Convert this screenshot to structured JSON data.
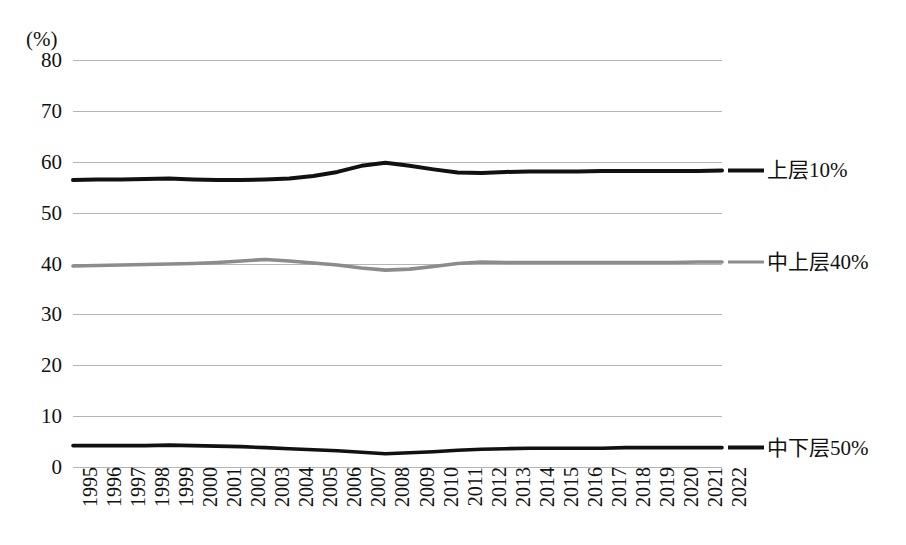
{
  "chart_data": {
    "type": "line",
    "title": "",
    "subtitle": "",
    "xlabel": "",
    "ylabel": "",
    "unit_label": "(%)",
    "grid": true,
    "legend_position": "right",
    "ylim": [
      0,
      80
    ],
    "y_ticks": [
      80,
      70,
      60,
      50,
      40,
      30,
      20,
      10,
      0
    ],
    "categories": [
      "1995",
      "1996",
      "1997",
      "1998",
      "1999",
      "2000",
      "2001",
      "2002",
      "2003",
      "2004",
      "2005",
      "2006",
      "2007",
      "2008",
      "2009",
      "2010",
      "2011",
      "2012",
      "2013",
      "2014",
      "2015",
      "2016",
      "2017",
      "2018",
      "2019",
      "2020",
      "2021",
      "2022"
    ],
    "series": [
      {
        "name": "上层10%",
        "color": "#111111",
        "width": 4.0,
        "values": [
          56.4,
          56.5,
          56.5,
          56.6,
          56.7,
          56.5,
          56.4,
          56.4,
          56.5,
          56.7,
          57.2,
          58.0,
          59.2,
          59.8,
          59.2,
          58.5,
          57.9,
          57.8,
          58.0,
          58.1,
          58.1,
          58.1,
          58.2,
          58.2,
          58.2,
          58.2,
          58.2,
          58.3
        ]
      },
      {
        "name": "中上层40%",
        "color": "#8c8c8c",
        "width": 3.6,
        "values": [
          39.5,
          39.6,
          39.7,
          39.8,
          39.9,
          40.0,
          40.2,
          40.5,
          40.8,
          40.5,
          40.1,
          39.7,
          39.1,
          38.7,
          38.9,
          39.4,
          40.0,
          40.3,
          40.2,
          40.2,
          40.2,
          40.2,
          40.2,
          40.2,
          40.2,
          40.2,
          40.3,
          40.3
        ]
      },
      {
        "name": "中下层50%",
        "color": "#111111",
        "width": 3.6,
        "values": [
          4.2,
          4.2,
          4.2,
          4.2,
          4.3,
          4.2,
          4.1,
          4.0,
          3.8,
          3.6,
          3.4,
          3.2,
          2.9,
          2.6,
          2.8,
          3.0,
          3.3,
          3.5,
          3.6,
          3.7,
          3.7,
          3.7,
          3.7,
          3.8,
          3.8,
          3.8,
          3.8,
          3.8
        ]
      }
    ]
  }
}
